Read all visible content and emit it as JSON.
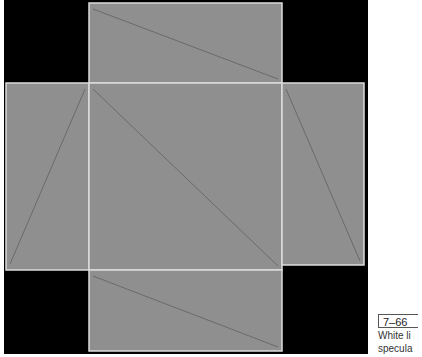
{
  "figure": {
    "number": "7–66",
    "caption_lines": [
      "White li",
      "specula"
    ]
  },
  "colors": {
    "background": "#000000",
    "panel_fill": "#8f8f8f",
    "panel_edge": "#dcdcdc",
    "diagonal": "#6a6a6a"
  },
  "net_panels": [
    {
      "name": "top",
      "x": 89,
      "y": 3,
      "w": 193,
      "h": 80,
      "diag": "tl-br"
    },
    {
      "name": "left",
      "x": 6,
      "y": 83,
      "w": 83,
      "h": 187,
      "diag": "tr-bl"
    },
    {
      "name": "center",
      "x": 89,
      "y": 83,
      "w": 193,
      "h": 187,
      "diag": "tl-br"
    },
    {
      "name": "right",
      "x": 282,
      "y": 83,
      "w": 82,
      "h": 182,
      "diag": "tl-br"
    },
    {
      "name": "bottom",
      "x": 89,
      "y": 270,
      "w": 193,
      "h": 81,
      "diag": "tl-br"
    }
  ]
}
